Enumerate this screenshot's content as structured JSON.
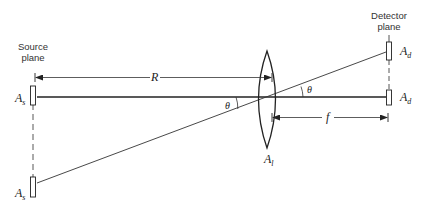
{
  "labels": {
    "source_plane": [
      "Source",
      "plane"
    ],
    "detector_plane": [
      "Detector",
      "plane"
    ],
    "R": "R",
    "f": "f",
    "theta_left": "θ",
    "theta_right": "θ",
    "source_aperture_top": {
      "base": "A",
      "sub": "s"
    },
    "source_aperture_bottom": {
      "base": "A",
      "sub": "s"
    },
    "detector_aperture_top": {
      "base": "A",
      "sub": "d"
    },
    "detector_aperture_bottom": {
      "base": "A",
      "sub": "d"
    },
    "lens_aperture": {
      "base": "A",
      "sub": "l"
    }
  },
  "colors": {
    "line": "#222222",
    "text": "#333333",
    "background": "#ffffff"
  }
}
